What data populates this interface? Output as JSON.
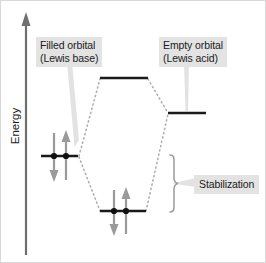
{
  "figure": {
    "type": "molecular-orbital-energy-diagram",
    "axis": {
      "y_label": "Energy",
      "direction": "up"
    },
    "labels": {
      "filled_orbital": "Filled orbital\n(Lewis base)",
      "empty_orbital": "Empty orbital\n(Lewis acid)",
      "stabilization": "Stabilization"
    },
    "levels": [
      {
        "name": "antibonding-orbital",
        "label": "",
        "electrons": 0,
        "x1": 100,
        "x2": 148,
        "y": 78
      },
      {
        "name": "empty-orbital-lewis-acid",
        "label": "Empty orbital (Lewis acid)",
        "electrons": 0,
        "x1": 168,
        "x2": 206,
        "y": 113
      },
      {
        "name": "filled-orbital-lewis-base",
        "label": "Filled orbital (Lewis base)",
        "electrons": 2,
        "x1": 41,
        "x2": 78,
        "y": 156
      },
      {
        "name": "bonding-orbital",
        "label": "",
        "electrons": 2,
        "x1": 100,
        "x2": 146,
        "y": 211
      }
    ],
    "colors": {
      "level_line": "#1a1a1a",
      "electron_dot": "#111111",
      "spin_arrow": "#9a9a9a",
      "correlation_line": "#b0b0b0",
      "callout_background": "#e3e3e3",
      "callout_text": "#1a1a1a",
      "axis": "#6e6e6e",
      "brace": "#9a9a9a",
      "leader": "#e0e0e0",
      "background": "#ffffff"
    }
  }
}
